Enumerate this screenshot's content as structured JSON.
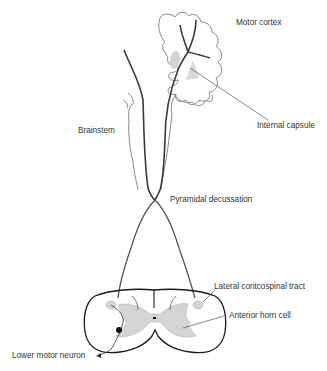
{
  "diagram": {
    "labels": {
      "motor_cortex": "Motor cortex",
      "internal_capsule": "Internal capsule",
      "brainstem": "Brainstem",
      "pyramidal_decussation": "Pyramidal decussation",
      "lateral_corticospinal_tract": "Lateral coritcospinal tract",
      "anterior_horn_cell": "Anterior horn cell",
      "lower_motor_neuron": "Lower motor neuron"
    },
    "colors": {
      "outline": "#8a8a8a",
      "tract": "#3a3a3a",
      "grey_matter": "#d4d4d4",
      "text": "#333333"
    }
  }
}
